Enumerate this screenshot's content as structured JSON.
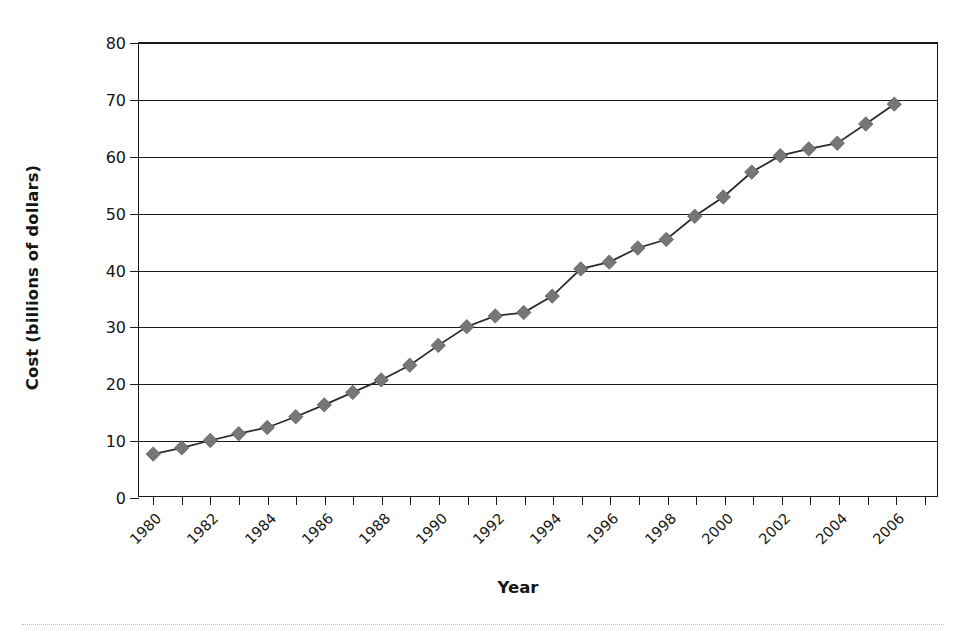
{
  "chart_data": {
    "type": "line",
    "title": "",
    "xlabel": "Year",
    "ylabel": "Cost (billions of dollars)",
    "xlim": [
      1979.5,
      2007.5
    ],
    "ylim": [
      0,
      80
    ],
    "ytick_step": 10,
    "xtick_step": 1,
    "xtick_label_step": 2,
    "grid": "horizontal",
    "legend": "none",
    "marker": "diamond",
    "series_color": "#767676",
    "line_color": "#2b2b2b",
    "yticks": [
      0,
      10,
      20,
      30,
      40,
      50,
      60,
      70,
      80
    ],
    "ytick_labels": [
      "0",
      "10",
      "20",
      "30",
      "40",
      "50",
      "60",
      "70",
      "80"
    ],
    "xticks": [
      1980,
      1981,
      1982,
      1983,
      1984,
      1985,
      1986,
      1987,
      1988,
      1989,
      1990,
      1991,
      1992,
      1993,
      1994,
      1995,
      1996,
      1997,
      1998,
      1999,
      2000,
      2001,
      2002,
      2003,
      2004,
      2005,
      2006,
      2007
    ],
    "xtick_labels": [
      "1980",
      "",
      "1982",
      "",
      "1984",
      "",
      "1986",
      "",
      "1988",
      "",
      "1990",
      "",
      "1992",
      "",
      "1994",
      "",
      "1996",
      "",
      "1998",
      "",
      "2000",
      "",
      "2002",
      "",
      "2004",
      "",
      "2006",
      ""
    ],
    "x": [
      1980,
      1981,
      1982,
      1983,
      1984,
      1985,
      1986,
      1987,
      1988,
      1989,
      1990,
      1991,
      1992,
      1993,
      1994,
      1995,
      1996,
      1997,
      1998,
      1999,
      2000,
      2001,
      2002,
      2003,
      2004,
      2005,
      2006,
      2007
    ],
    "values": [
      7.4,
      8.5,
      9.8,
      11.0,
      12.1,
      14.0,
      16.1,
      18.3,
      20.5,
      23.1,
      26.6,
      29.9,
      31.8,
      32.4,
      35.3,
      40.1,
      41.3,
      43.8,
      45.3,
      49.4,
      52.8,
      57.2,
      60.1,
      61.3,
      62.3,
      65.7,
      69.2,
      69.2
    ],
    "series": [
      {
        "name": "Cost",
        "values": [
          7.4,
          8.5,
          9.8,
          11.0,
          12.1,
          14.0,
          16.1,
          18.3,
          20.5,
          23.1,
          26.6,
          29.9,
          31.8,
          32.4,
          35.3,
          40.1,
          41.3,
          43.8,
          45.3,
          49.4,
          52.8,
          57.2,
          60.1,
          61.3,
          62.3,
          65.7,
          69.2,
          69.2
        ]
      }
    ],
    "n_points": 27
  }
}
